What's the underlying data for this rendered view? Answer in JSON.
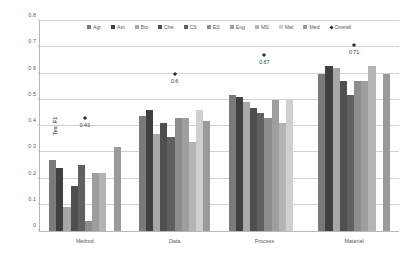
{
  "chart_data": {
    "type": "bar",
    "title": "",
    "xlabel": "",
    "ylabel": "Test F1",
    "ylim": [
      0,
      0.8
    ],
    "ytick_labels": [
      "0",
      "0.1",
      "0.2",
      "0.3",
      "0.4",
      "0.5",
      "0.6",
      "0.7",
      "0.8"
    ],
    "ytick_values": [
      0,
      0.1,
      0.2,
      0.3,
      0.4,
      0.5,
      0.6,
      0.7,
      0.8
    ],
    "grid": true,
    "legend_position": "top-center",
    "categories": [
      "Method",
      "Data",
      "Process",
      "Material"
    ],
    "series": [
      {
        "name": "Agr",
        "color": "#7a7a7a",
        "values": [
          0.27,
          0.44,
          0.52,
          0.6
        ]
      },
      {
        "name": "Ast",
        "color": "#404040",
        "values": [
          0.24,
          0.46,
          0.51,
          0.63
        ]
      },
      {
        "name": "Bio",
        "color": "#a8a8a8",
        "values": [
          0.09,
          0.37,
          0.49,
          0.62
        ]
      },
      {
        "name": "Che",
        "color": "#4f4f4f",
        "values": [
          0.17,
          0.41,
          0.47,
          0.57
        ]
      },
      {
        "name": "CS",
        "color": "#606060",
        "values": [
          0.25,
          0.36,
          0.45,
          0.52
        ]
      },
      {
        "name": "ES",
        "color": "#8c8c8c",
        "values": [
          0.04,
          0.43,
          0.43,
          0.57
        ]
      },
      {
        "name": "Eng",
        "color": "#9e9e9e",
        "values": [
          0.22,
          0.43,
          0.5,
          0.57
        ]
      },
      {
        "name": "MS",
        "color": "#b4b4b4",
        "values": [
          0.22,
          0.34,
          0.41,
          0.63
        ]
      },
      {
        "name": "Mat",
        "color": "#cfcfcf",
        "values": [
          0.0,
          0.46,
          0.5,
          0.0
        ]
      },
      {
        "name": "Med",
        "color": "#9a9a9a",
        "values": [
          0.32,
          0.42,
          0.0,
          0.6
        ]
      }
    ],
    "overall": {
      "name": "Overall",
      "color": "#2f2f2f",
      "marker": "diamond",
      "values": [
        0.43,
        0.6,
        0.67,
        0.71
      ],
      "labels": [
        "0.43",
        "0.6",
        "0.67",
        "0.71"
      ]
    }
  }
}
